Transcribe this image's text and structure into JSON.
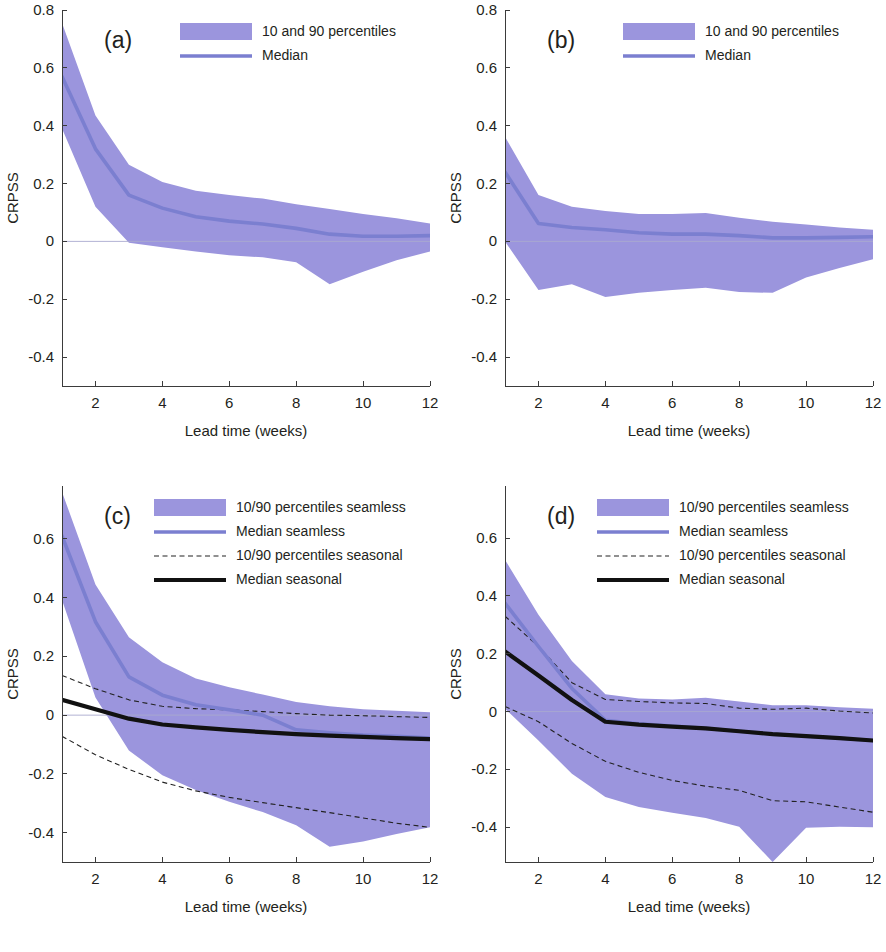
{
  "figure": {
    "background": "#ffffff",
    "band_color": "#9b95dd",
    "median_seamless_color": "#7b7fd0",
    "median_seasonal_color": "#111111",
    "pct_seasonal_color": "#222222",
    "zero_line_color": "#a9a9cf",
    "axis_color": "#3b3b3b"
  },
  "chart_data": [
    {
      "id": "a",
      "type": "area",
      "panel_label": "(a)",
      "title": "",
      "xlabel": "Lead time (weeks)",
      "ylabel": "CRPSS",
      "xlim": [
        1,
        12
      ],
      "ylim": [
        -0.5,
        0.8
      ],
      "xticks": [
        2,
        4,
        6,
        8,
        10,
        12
      ],
      "xtick_labels": [
        "2",
        "4",
        "6",
        "8",
        "10",
        "12"
      ],
      "yticks": [
        -0.4,
        -0.2,
        0,
        0.2,
        0.4,
        0.6,
        0.8
      ],
      "ytick_labels": [
        "-0.4",
        "-0.2",
        "0",
        "0.2",
        "0.4",
        "0.6",
        "0.8"
      ],
      "grid": false,
      "zero_line": true,
      "legend_position": "top-right",
      "legend": [
        {
          "label": "10 and 90 percentiles",
          "marker": "band",
          "color": "#9b95dd"
        },
        {
          "label": "Median",
          "marker": "line",
          "color": "#7b7fd0"
        }
      ],
      "x": [
        1,
        2,
        3,
        4,
        5,
        6,
        7,
        8,
        9,
        10,
        11,
        12
      ],
      "series": [
        {
          "name": "90th percentile seamless",
          "style": "band-upper",
          "values": [
            0.755,
            0.435,
            0.265,
            0.205,
            0.175,
            0.16,
            0.148,
            0.128,
            0.112,
            0.095,
            0.08,
            0.062
          ]
        },
        {
          "name": "Median seamless",
          "style": "line-seamless",
          "values": [
            0.57,
            0.32,
            0.16,
            0.115,
            0.085,
            0.07,
            0.06,
            0.045,
            0.025,
            0.018,
            0.018,
            0.02
          ]
        },
        {
          "name": "10th percentile seamless",
          "style": "band-lower",
          "values": [
            0.39,
            0.12,
            -0.005,
            -0.02,
            -0.035,
            -0.048,
            -0.055,
            -0.072,
            -0.148,
            -0.105,
            -0.065,
            -0.035
          ]
        }
      ]
    },
    {
      "id": "b",
      "type": "area",
      "panel_label": "(b)",
      "title": "",
      "xlabel": "Lead time (weeks)",
      "ylabel": "CRPSS",
      "xlim": [
        1,
        12
      ],
      "ylim": [
        -0.5,
        0.8
      ],
      "xticks": [
        2,
        4,
        6,
        8,
        10,
        12
      ],
      "xtick_labels": [
        "2",
        "4",
        "6",
        "8",
        "10",
        "12"
      ],
      "yticks": [
        -0.4,
        -0.2,
        0,
        0.2,
        0.4,
        0.6,
        0.8
      ],
      "ytick_labels": [
        "-0.4",
        "-0.2",
        "0",
        "0.2",
        "0.4",
        "0.6",
        "0.8"
      ],
      "grid": false,
      "zero_line": true,
      "legend_position": "top-right",
      "legend": [
        {
          "label": "10 and 90 percentiles",
          "marker": "band",
          "color": "#9b95dd"
        },
        {
          "label": "Median",
          "marker": "line",
          "color": "#7b7fd0"
        }
      ],
      "x": [
        1,
        2,
        3,
        4,
        5,
        6,
        7,
        8,
        9,
        10,
        11,
        12
      ],
      "series": [
        {
          "name": "90th percentile seamless",
          "style": "band-upper",
          "values": [
            0.362,
            0.16,
            0.12,
            0.105,
            0.095,
            0.095,
            0.098,
            0.082,
            0.068,
            0.058,
            0.048,
            0.04
          ]
        },
        {
          "name": "Median seamless",
          "style": "line-seamless",
          "values": [
            0.24,
            0.062,
            0.048,
            0.04,
            0.03,
            0.025,
            0.025,
            0.02,
            0.012,
            0.012,
            0.014,
            0.016
          ]
        },
        {
          "name": "10th percentile seamless",
          "style": "band-lower",
          "values": [
            0.0,
            -0.168,
            -0.148,
            -0.192,
            -0.178,
            -0.168,
            -0.16,
            -0.175,
            -0.178,
            -0.125,
            -0.092,
            -0.062
          ]
        }
      ]
    },
    {
      "id": "c",
      "type": "area",
      "panel_label": "(c)",
      "title": "",
      "xlabel": "Lead time (weeks)",
      "ylabel": "CRPSS",
      "xlim": [
        1,
        12
      ],
      "ylim": [
        -0.5,
        0.78
      ],
      "xticks": [
        2,
        4,
        6,
        8,
        10,
        12
      ],
      "xtick_labels": [
        "2",
        "4",
        "6",
        "8",
        "10",
        "12"
      ],
      "yticks": [
        -0.4,
        -0.2,
        0,
        0.2,
        0.4,
        0.6
      ],
      "ytick_labels": [
        "-0.4",
        "-0.2",
        "0",
        "0.2",
        "0.4",
        "0.6"
      ],
      "grid": false,
      "zero_line": true,
      "legend_position": "top-right",
      "legend": [
        {
          "label": "10/90 percentiles seamless",
          "marker": "band",
          "color": "#9b95dd"
        },
        {
          "label": "Median seamless",
          "marker": "line",
          "color": "#7b7fd0"
        },
        {
          "label": "10/90 percentiles seasonal",
          "marker": "dashed",
          "color": "#222222"
        },
        {
          "label": "Median seasonal",
          "marker": "line-thick",
          "color": "#111111"
        }
      ],
      "x": [
        1,
        2,
        3,
        4,
        5,
        6,
        7,
        8,
        9,
        10,
        11,
        12
      ],
      "series": [
        {
          "name": "90th percentile seamless",
          "style": "band-upper",
          "values": [
            0.76,
            0.445,
            0.265,
            0.18,
            0.125,
            0.095,
            0.07,
            0.045,
            0.03,
            0.02,
            0.015,
            0.01
          ]
        },
        {
          "name": "Median seamless",
          "style": "line-seamless",
          "values": [
            0.61,
            0.318,
            0.13,
            0.068,
            0.035,
            0.018,
            0.0,
            -0.05,
            -0.06,
            -0.068,
            -0.072,
            -0.078
          ]
        },
        {
          "name": "10th percentile seamless",
          "style": "band-lower",
          "values": [
            0.392,
            0.06,
            -0.12,
            -0.205,
            -0.255,
            -0.295,
            -0.33,
            -0.375,
            -0.448,
            -0.43,
            -0.405,
            -0.382
          ]
        },
        {
          "name": "90th percentile seasonal",
          "style": "dashed",
          "values": [
            0.135,
            0.09,
            0.052,
            0.03,
            0.022,
            0.018,
            0.012,
            0.005,
            0.0,
            -0.002,
            -0.005,
            -0.008
          ]
        },
        {
          "name": "Median seasonal",
          "style": "line-seasonal",
          "values": [
            0.052,
            0.02,
            -0.012,
            -0.032,
            -0.042,
            -0.05,
            -0.058,
            -0.065,
            -0.07,
            -0.074,
            -0.078,
            -0.082
          ]
        },
        {
          "name": "10th percentile seasonal",
          "style": "dashed",
          "values": [
            -0.072,
            -0.135,
            -0.185,
            -0.228,
            -0.258,
            -0.28,
            -0.298,
            -0.315,
            -0.332,
            -0.35,
            -0.368,
            -0.382
          ]
        }
      ]
    },
    {
      "id": "d",
      "type": "area",
      "panel_label": "(d)",
      "title": "",
      "xlabel": "Lead time (weeks)",
      "ylabel": "CRPSS",
      "xlim": [
        1,
        12
      ],
      "ylim": [
        -0.52,
        0.78
      ],
      "xticks": [
        2,
        4,
        6,
        8,
        10,
        12
      ],
      "xtick_labels": [
        "2",
        "4",
        "6",
        "8",
        "10",
        "12"
      ],
      "yticks": [
        -0.4,
        -0.2,
        0,
        0.2,
        0.4,
        0.6
      ],
      "ytick_labels": [
        "-0.4",
        "-0.2",
        "0",
        "0.2",
        "0.4",
        "0.6"
      ],
      "grid": false,
      "zero_line": true,
      "legend_position": "top-right",
      "legend": [
        {
          "label": "10/90 percentiles seamless",
          "marker": "band",
          "color": "#9b95dd"
        },
        {
          "label": "Median seamless",
          "marker": "line",
          "color": "#7b7fd0"
        },
        {
          "label": "10/90 percentiles seasonal",
          "marker": "dashed",
          "color": "#222222"
        },
        {
          "label": "Median seasonal",
          "marker": "line-thick",
          "color": "#111111"
        }
      ],
      "x": [
        1,
        2,
        3,
        4,
        5,
        6,
        7,
        8,
        9,
        10,
        11,
        12
      ],
      "series": [
        {
          "name": "90th percentile seamless",
          "style": "band-upper",
          "values": [
            0.525,
            0.335,
            0.175,
            0.06,
            0.045,
            0.042,
            0.048,
            0.035,
            0.022,
            0.022,
            0.015,
            0.01
          ]
        },
        {
          "name": "Median seamless",
          "style": "line-seamless",
          "values": [
            0.375,
            0.225,
            0.08,
            -0.03,
            -0.042,
            -0.05,
            -0.058,
            -0.068,
            -0.078,
            -0.085,
            -0.092,
            -0.1
          ]
        },
        {
          "name": "10th percentile seamless",
          "style": "band-lower",
          "values": [
            0.01,
            -0.1,
            -0.215,
            -0.295,
            -0.33,
            -0.35,
            -0.368,
            -0.398,
            -0.52,
            -0.402,
            -0.398,
            -0.4
          ]
        },
        {
          "name": "90th percentile seasonal",
          "style": "dashed",
          "values": [
            0.33,
            0.225,
            0.1,
            0.042,
            0.035,
            0.03,
            0.028,
            0.012,
            0.008,
            0.012,
            0.002,
            -0.005
          ]
        },
        {
          "name": "Median seasonal",
          "style": "line-seasonal",
          "values": [
            0.208,
            0.125,
            0.04,
            -0.035,
            -0.045,
            -0.052,
            -0.058,
            -0.068,
            -0.078,
            -0.085,
            -0.092,
            -0.1
          ]
        },
        {
          "name": "10th percentile seasonal",
          "style": "dashed",
          "values": [
            0.018,
            -0.035,
            -0.11,
            -0.172,
            -0.21,
            -0.238,
            -0.258,
            -0.272,
            -0.308,
            -0.312,
            -0.33,
            -0.348
          ]
        }
      ]
    }
  ]
}
